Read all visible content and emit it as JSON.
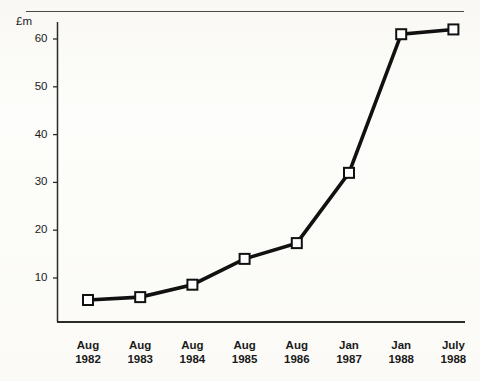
{
  "chart_data": {
    "type": "line",
    "title": "",
    "subtitle": "",
    "xlabel": "",
    "ylabel": "£m",
    "ylim": [
      0,
      64
    ],
    "yticks": [
      10,
      20,
      30,
      40,
      50,
      60
    ],
    "ytick_labels": [
      "10",
      "20",
      "30",
      "40",
      "50",
      "60"
    ],
    "grid": false,
    "legend": null,
    "marker": "open-square",
    "line_color": "#111111",
    "marker_face_color": "#ffffff",
    "marker_edge_color": "#111111",
    "categories": [
      "Aug 1982",
      "Aug 1983",
      "Aug 1984",
      "Aug 1985",
      "Aug 1986",
      "Jan 1987",
      "Jan 1988",
      "July 1988"
    ],
    "xtick_labels": [
      {
        "line1": "Aug",
        "line2": "1982"
      },
      {
        "line1": "Aug",
        "line2": "1983"
      },
      {
        "line1": "Aug",
        "line2": "1984"
      },
      {
        "line1": "Aug",
        "line2": "1985"
      },
      {
        "line1": "Aug",
        "line2": "1986"
      },
      {
        "line1": "Jan",
        "line2": "1987"
      },
      {
        "line1": "Jan",
        "line2": "1988"
      },
      {
        "line1": "July",
        "line2": "1988"
      }
    ],
    "values": [
      5.4,
      6.0,
      8.6,
      14.0,
      17.3,
      32.0,
      61.0,
      62.0
    ]
  }
}
